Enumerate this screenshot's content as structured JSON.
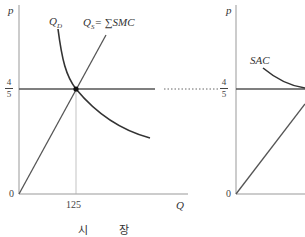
{
  "market_panel": {
    "y_axis_label": "p",
    "x_axis_label": "Q",
    "origin_label": "0",
    "demand_label": "Q",
    "demand_sub": "D",
    "supply_label": "Q",
    "supply_sub": "S",
    "supply_rhs": "= ∑SMC",
    "price_num": "4",
    "price_den": "5",
    "quantity_tick": "125",
    "caption": " 시 장"
  },
  "firm_panel": {
    "y_axis_label": "p",
    "origin_label": "0",
    "sac_label": "SAC",
    "price_num": "4",
    "price_den": "5"
  },
  "colors": {
    "axis": "#999999",
    "curve": "#333333",
    "price_line": "#555555"
  }
}
